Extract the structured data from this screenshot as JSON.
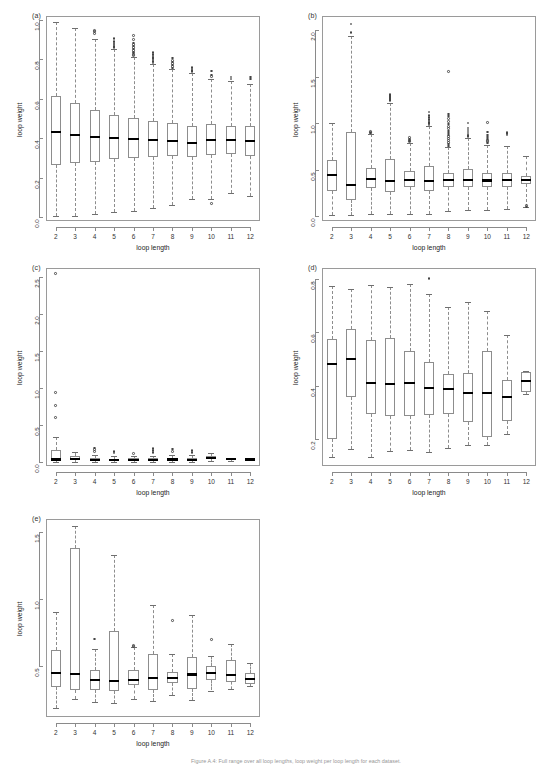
{
  "figure": {
    "caption": "Figure A.4: Full range over all loop lengths, loop weight per loop length for each dataset.",
    "xlabel": "loop length",
    "ylabel": "loop weight",
    "x_categories": [
      2,
      3,
      4,
      5,
      6,
      7,
      8,
      9,
      10,
      11,
      12
    ]
  },
  "chart_data": [
    {
      "type": "box",
      "panel": "(a)",
      "title": "",
      "xlabel": "loop length",
      "ylabel": "loop weight",
      "categories": [
        2,
        3,
        4,
        5,
        6,
        7,
        8,
        9,
        10,
        11,
        12
      ],
      "ylim": [
        -0.02,
        1.02
      ],
      "yticks": [
        0.0,
        0.2,
        0.4,
        0.6,
        0.8,
        1.0
      ],
      "ytick_labels": [
        "0.0",
        "0.2",
        "0.4",
        "0.6",
        "0.8",
        "1.0"
      ],
      "grid": false,
      "boxes": [
        {
          "x": 2,
          "whisker_low": 0.005,
          "q1": 0.265,
          "median": 0.43,
          "q3": 0.615,
          "whisker_high": 0.99,
          "outliers": []
        },
        {
          "x": 3,
          "whisker_low": 0.007,
          "q1": 0.272,
          "median": 0.418,
          "q3": 0.577,
          "whisker_high": 0.958,
          "outliers": []
        },
        {
          "x": 4,
          "whisker_low": 0.016,
          "q1": 0.281,
          "median": 0.408,
          "q3": 0.543,
          "whisker_high": 0.905,
          "outliers": [
            0.93,
            0.94,
            0.947
          ]
        },
        {
          "x": 5,
          "whisker_low": 0.027,
          "q1": 0.294,
          "median": 0.4,
          "q3": 0.517,
          "whisker_high": 0.852,
          "outliers": [
            0.86,
            0.866,
            0.872,
            0.878,
            0.884,
            0.89,
            0.905
          ]
        },
        {
          "x": 6,
          "whisker_low": 0.033,
          "q1": 0.298,
          "median": 0.397,
          "q3": 0.502,
          "whisker_high": 0.812,
          "outliers": [
            0.82,
            0.826,
            0.832,
            0.838,
            0.845,
            0.852,
            0.86,
            0.868,
            0.876,
            0.884,
            0.9,
            0.92
          ]
        },
        {
          "x": 7,
          "whisker_low": 0.046,
          "q1": 0.305,
          "median": 0.392,
          "q3": 0.487,
          "whisker_high": 0.775,
          "outliers": [
            0.782,
            0.789,
            0.796,
            0.803,
            0.81,
            0.818,
            0.826,
            0.836
          ]
        },
        {
          "x": 8,
          "whisker_low": 0.063,
          "q1": 0.309,
          "median": 0.386,
          "q3": 0.478,
          "whisker_high": 0.75,
          "outliers": [
            0.757,
            0.764,
            0.771,
            0.778,
            0.786,
            0.795,
            0.806
          ]
        },
        {
          "x": 9,
          "whisker_low": 0.093,
          "q1": 0.305,
          "median": 0.378,
          "q3": 0.464,
          "whisker_high": 0.73,
          "outliers": [
            0.737,
            0.744,
            0.751,
            0.758
          ]
        },
        {
          "x": 10,
          "whisker_low": 0.093,
          "q1": 0.313,
          "median": 0.393,
          "q3": 0.472,
          "whisker_high": 0.7,
          "outliers": [
            0.712,
            0.72,
            0.74,
            0.068
          ]
        },
        {
          "x": 11,
          "whisker_low": 0.124,
          "q1": 0.318,
          "median": 0.393,
          "q3": 0.462,
          "whisker_high": 0.688,
          "outliers": [
            0.7,
            0.71
          ]
        },
        {
          "x": 12,
          "whisker_low": 0.106,
          "q1": 0.311,
          "median": 0.386,
          "q3": 0.46,
          "whisker_high": 0.675,
          "outliers": [
            0.7,
            0.71
          ]
        }
      ]
    },
    {
      "type": "box",
      "panel": "(b)",
      "title": "",
      "xlabel": "loop length",
      "ylabel": "loop weight",
      "categories": [
        2,
        3,
        4,
        5,
        6,
        7,
        8,
        9,
        10,
        11,
        12
      ],
      "ylim": [
        -0.05,
        2.15
      ],
      "yticks": [
        0.0,
        0.5,
        1.0,
        1.5,
        2.0
      ],
      "ytick_labels": [
        "0.0",
        "0.5",
        "1.0",
        "1.5",
        "2.0"
      ],
      "grid": false,
      "boxes": [
        {
          "x": 2,
          "whisker_low": 0.01,
          "q1": 0.275,
          "median": 0.445,
          "q3": 0.605,
          "whisker_high": 1.0,
          "outliers": []
        },
        {
          "x": 3,
          "whisker_low": 0.015,
          "q1": 0.175,
          "median": 0.34,
          "q3": 0.9,
          "whisker_high": 1.94,
          "outliers": [
            1.975,
            2.065
          ]
        },
        {
          "x": 4,
          "whisker_low": 0.028,
          "q1": 0.3,
          "median": 0.405,
          "q3": 0.52,
          "whisker_high": 0.88,
          "outliers": [
            0.893,
            0.9,
            0.908
          ]
        },
        {
          "x": 5,
          "whisker_low": 0.02,
          "q1": 0.26,
          "median": 0.378,
          "q3": 0.62,
          "whisker_high": 1.215,
          "outliers": [
            1.24,
            1.255,
            1.265,
            1.275,
            1.285,
            1.295,
            1.305
          ]
        },
        {
          "x": 6,
          "whisker_low": 0.02,
          "q1": 0.31,
          "median": 0.395,
          "q3": 0.49,
          "whisker_high": 0.79,
          "outliers": [
            0.8,
            0.81,
            0.82,
            0.832,
            0.845
          ]
        },
        {
          "x": 7,
          "whisker_low": 0.022,
          "q1": 0.27,
          "median": 0.378,
          "q3": 0.54,
          "whisker_high": 0.965,
          "outliers": [
            0.98,
            0.995,
            1.01,
            1.025,
            1.04,
            1.06,
            1.085,
            1.118
          ]
        },
        {
          "x": 8,
          "whisker_low": 0.06,
          "q1": 0.312,
          "median": 0.39,
          "q3": 0.468,
          "whisker_high": 0.74,
          "outliers": [
            0.755,
            0.775,
            0.795,
            0.815,
            0.835,
            0.855,
            0.875,
            0.895,
            0.915,
            0.94,
            0.965,
            0.99,
            1.02,
            1.05,
            1.075,
            1.1,
            1.555
          ]
        },
        {
          "x": 9,
          "whisker_low": 0.065,
          "q1": 0.318,
          "median": 0.388,
          "q3": 0.505,
          "whisker_high": 0.84,
          "outliers": [
            0.855,
            0.87,
            0.885,
            0.905,
            0.925,
            0.95,
            1.0
          ]
        },
        {
          "x": 10,
          "whisker_low": 0.068,
          "q1": 0.315,
          "median": 0.385,
          "q3": 0.47,
          "whisker_high": 0.77,
          "outliers": [
            0.785,
            0.8,
            0.815,
            0.83,
            0.85,
            0.875,
            0.905,
            1.01
          ]
        },
        {
          "x": 11,
          "whisker_low": 0.078,
          "q1": 0.32,
          "median": 0.392,
          "q3": 0.47,
          "whisker_high": 0.76,
          "outliers": [
            0.875,
            0.888,
            0.9
          ]
        },
        {
          "x": 12,
          "whisker_low": 0.105,
          "q1": 0.345,
          "median": 0.395,
          "q3": 0.43,
          "whisker_high": 0.65,
          "outliers": [
            0.115,
            0.1
          ]
        }
      ]
    },
    {
      "type": "box",
      "panel": "(c)",
      "title": "",
      "xlabel": "loop length",
      "ylabel": "loop weight",
      "categories": [
        2,
        3,
        4,
        5,
        6,
        7,
        8,
        9,
        10,
        11,
        12
      ],
      "ylim": [
        -0.06,
        2.62
      ],
      "yticks": [
        0.0,
        0.5,
        1.0,
        1.5,
        2.0,
        2.5
      ],
      "ytick_labels": [
        "0.0",
        "0.5",
        "1.0",
        "1.5",
        "2.0",
        "2.5"
      ],
      "grid": false,
      "boxes": [
        {
          "x": 2,
          "whisker_low": 0.0,
          "q1": 0.012,
          "median": 0.03,
          "q3": 0.15,
          "whisker_high": 0.33,
          "outliers": [
            0.6,
            0.755,
            0.935,
            2.545
          ]
        },
        {
          "x": 3,
          "whisker_low": 0.0,
          "q1": 0.018,
          "median": 0.04,
          "q3": 0.075,
          "whisker_high": 0.135,
          "outliers": []
        },
        {
          "x": 4,
          "whisker_low": 0.0,
          "q1": 0.012,
          "median": 0.022,
          "q3": 0.045,
          "whisker_high": 0.085,
          "outliers": [
            0.135,
            0.165,
            0.185
          ]
        },
        {
          "x": 5,
          "whisker_low": 0.0,
          "q1": 0.012,
          "median": 0.022,
          "q3": 0.04,
          "whisker_high": 0.07,
          "outliers": [
            0.115,
            0.14
          ]
        },
        {
          "x": 6,
          "whisker_low": 0.0,
          "q1": 0.012,
          "median": 0.025,
          "q3": 0.045,
          "whisker_high": 0.075,
          "outliers": [
            0.11
          ]
        },
        {
          "x": 7,
          "whisker_low": 0.0,
          "q1": 0.012,
          "median": 0.022,
          "q3": 0.042,
          "whisker_high": 0.08,
          "outliers": [
            0.12,
            0.15,
            0.175
          ]
        },
        {
          "x": 8,
          "whisker_low": 0.0,
          "q1": 0.015,
          "median": 0.03,
          "q3": 0.055,
          "whisker_high": 0.095,
          "outliers": [
            0.14,
            0.17
          ]
        },
        {
          "x": 9,
          "whisker_low": 0.0,
          "q1": 0.012,
          "median": 0.025,
          "q3": 0.048,
          "whisker_high": 0.085,
          "outliers": [
            0.12,
            0.15
          ]
        },
        {
          "x": 10,
          "whisker_low": 0.005,
          "q1": 0.03,
          "median": 0.048,
          "q3": 0.072,
          "whisker_high": 0.115,
          "outliers": []
        },
        {
          "x": 11,
          "whisker_low": 0.012,
          "q1": 0.025,
          "median": 0.032,
          "q3": 0.042,
          "whisker_high": 0.055,
          "outliers": []
        },
        {
          "x": 12,
          "whisker_low": 0.015,
          "q1": 0.025,
          "median": 0.03,
          "q3": 0.038,
          "whisker_high": 0.048,
          "outliers": []
        }
      ]
    },
    {
      "type": "box",
      "panel": "(d)",
      "title": "",
      "xlabel": "loop length",
      "ylabel": "loop weight",
      "categories": [
        2,
        3,
        4,
        5,
        6,
        7,
        8,
        9,
        10,
        11,
        12
      ],
      "ylim": [
        0.1,
        0.84
      ],
      "yticks": [
        0.2,
        0.4,
        0.6,
        0.8
      ],
      "ytick_labels": [
        "0.2",
        "0.4",
        "0.6",
        "0.8"
      ],
      "grid": false,
      "boxes": [
        {
          "x": 2,
          "whisker_low": 0.135,
          "q1": 0.202,
          "median": 0.482,
          "q3": 0.573,
          "whisker_high": 0.772,
          "outliers": []
        },
        {
          "x": 3,
          "whisker_low": 0.165,
          "q1": 0.358,
          "median": 0.5,
          "q3": 0.613,
          "whisker_high": 0.762,
          "outliers": []
        },
        {
          "x": 4,
          "whisker_low": 0.135,
          "q1": 0.293,
          "median": 0.41,
          "q3": 0.572,
          "whisker_high": 0.775,
          "outliers": []
        },
        {
          "x": 5,
          "whisker_low": 0.157,
          "q1": 0.288,
          "median": 0.408,
          "q3": 0.578,
          "whisker_high": 0.77,
          "outliers": []
        },
        {
          "x": 6,
          "whisker_low": 0.158,
          "q1": 0.287,
          "median": 0.412,
          "q3": 0.53,
          "whisker_high": 0.782,
          "outliers": []
        },
        {
          "x": 7,
          "whisker_low": 0.152,
          "q1": 0.292,
          "median": 0.392,
          "q3": 0.49,
          "whisker_high": 0.742,
          "outliers": [
            0.8
          ]
        },
        {
          "x": 8,
          "whisker_low": 0.168,
          "q1": 0.293,
          "median": 0.387,
          "q3": 0.443,
          "whisker_high": 0.693,
          "outliers": []
        },
        {
          "x": 9,
          "whisker_low": 0.18,
          "q1": 0.265,
          "median": 0.372,
          "q3": 0.448,
          "whisker_high": 0.712,
          "outliers": []
        },
        {
          "x": 10,
          "whisker_low": 0.178,
          "q1": 0.207,
          "median": 0.372,
          "q3": 0.53,
          "whisker_high": 0.68,
          "outliers": []
        },
        {
          "x": 11,
          "whisker_low": 0.218,
          "q1": 0.268,
          "median": 0.358,
          "q3": 0.422,
          "whisker_high": 0.588,
          "outliers": []
        },
        {
          "x": 12,
          "whisker_low": 0.368,
          "q1": 0.378,
          "median": 0.418,
          "q3": 0.452,
          "whisker_high": 0.455,
          "outliers": []
        }
      ]
    },
    {
      "type": "box",
      "panel": "(e)",
      "title": "",
      "xlabel": "loop length",
      "ylabel": "loop weight",
      "categories": [
        2,
        3,
        4,
        5,
        6,
        7,
        8,
        9,
        10,
        11,
        12
      ],
      "ylim": [
        0.12,
        1.6
      ],
      "yticks": [
        0.5,
        1.0,
        1.5
      ],
      "ytick_labels": [
        "0.5",
        "1.0",
        "1.5"
      ],
      "grid": false,
      "boxes": [
        {
          "x": 2,
          "whisker_low": 0.185,
          "q1": 0.345,
          "median": 0.452,
          "q3": 0.618,
          "whisker_high": 0.905,
          "outliers": []
        },
        {
          "x": 3,
          "whisker_low": 0.255,
          "q1": 0.32,
          "median": 0.443,
          "q3": 1.383,
          "whisker_high": 1.545,
          "outliers": []
        },
        {
          "x": 4,
          "whisker_low": 0.235,
          "q1": 0.322,
          "median": 0.398,
          "q3": 0.475,
          "whisker_high": 0.625,
          "outliers": [
            0.702
          ]
        },
        {
          "x": 5,
          "whisker_low": 0.228,
          "q1": 0.318,
          "median": 0.392,
          "q3": 0.762,
          "whisker_high": 1.332,
          "outliers": []
        },
        {
          "x": 6,
          "whisker_low": 0.258,
          "q1": 0.358,
          "median": 0.398,
          "q3": 0.468,
          "whisker_high": 0.64,
          "outliers": [
            0.648,
            0.655
          ]
        },
        {
          "x": 7,
          "whisker_low": 0.238,
          "q1": 0.322,
          "median": 0.412,
          "q3": 0.588,
          "whisker_high": 0.955,
          "outliers": []
        },
        {
          "x": 8,
          "whisker_low": 0.288,
          "q1": 0.375,
          "median": 0.415,
          "q3": 0.455,
          "whisker_high": 0.592,
          "outliers": [
            0.842
          ]
        },
        {
          "x": 9,
          "whisker_low": 0.248,
          "q1": 0.332,
          "median": 0.438,
          "q3": 0.565,
          "whisker_high": 0.885,
          "outliers": []
        },
        {
          "x": 10,
          "whisker_low": 0.318,
          "q1": 0.398,
          "median": 0.448,
          "q3": 0.5,
          "whisker_high": 0.578,
          "outliers": [
            0.7
          ]
        },
        {
          "x": 11,
          "whisker_low": 0.33,
          "q1": 0.378,
          "median": 0.432,
          "q3": 0.545,
          "whisker_high": 0.662,
          "outliers": []
        },
        {
          "x": 12,
          "whisker_low": 0.348,
          "q1": 0.368,
          "median": 0.402,
          "q3": 0.448,
          "whisker_high": 0.52,
          "outliers": []
        }
      ]
    }
  ],
  "panels": [
    {
      "label": "(a)"
    },
    {
      "label": "(b)"
    },
    {
      "label": "(c)"
    },
    {
      "label": "(d)"
    },
    {
      "label": "(e)"
    }
  ]
}
